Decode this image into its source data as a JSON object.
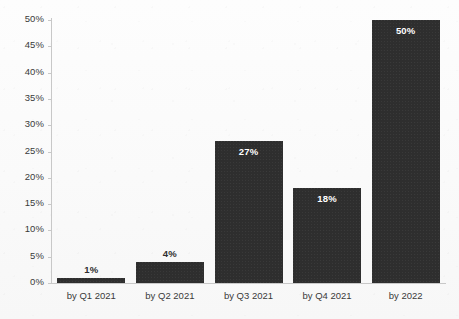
{
  "chart_data": {
    "type": "bar",
    "title": "",
    "subtitle": "",
    "xlabel": "",
    "ylabel": "",
    "categories": [
      "by Q1 2021",
      "by Q2 2021",
      "by Q3 2021",
      "by Q4 2021",
      "by 2022"
    ],
    "values": [
      1,
      4,
      27,
      18,
      50
    ],
    "data_labels": [
      "1%",
      "4%",
      "27%",
      "18%",
      "50%"
    ],
    "ylim": [
      0,
      50
    ],
    "ytick_values": [
      0,
      5,
      10,
      15,
      20,
      25,
      30,
      35,
      40,
      45,
      50
    ],
    "ytick_labels": [
      "0%",
      "5%",
      "10%",
      "15%",
      "20%",
      "25%",
      "30%",
      "35%",
      "40%",
      "45%",
      "50%"
    ],
    "grid": false,
    "legend": false,
    "legend_position": "none",
    "orientation": "vertical",
    "bar_color": "#2e2e2e",
    "label_color_inside": "#ffffff",
    "label_color_outside": "#2e2e2e",
    "axis_color": "#c8c8c8",
    "background_color": "#fcfcfc"
  }
}
